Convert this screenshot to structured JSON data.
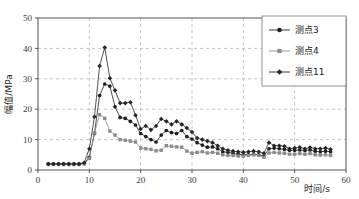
{
  "chart_data": {
    "type": "line",
    "title": "",
    "xlabel": "时间/s",
    "ylabel": "幅值/MPa",
    "xlim": [
      0,
      60
    ],
    "ylim": [
      0,
      50
    ],
    "xticks": [
      0,
      10,
      20,
      30,
      40,
      50,
      60
    ],
    "yticks": [
      0,
      10,
      20,
      30,
      40,
      50
    ],
    "grid": true,
    "legend_position": "top-right",
    "series": [
      {
        "name": "测点3",
        "color": "#1f1f1f",
        "marker": "circle",
        "x": [
          2,
          3,
          4,
          5,
          6,
          7,
          8,
          9,
          10,
          11,
          12,
          13,
          14,
          15,
          16,
          17,
          18,
          19,
          20,
          21,
          22,
          23,
          24,
          25,
          26,
          27,
          28,
          29,
          30,
          31,
          32,
          33,
          34,
          35,
          36,
          37,
          38,
          39,
          40,
          41,
          42,
          43,
          44,
          45,
          46,
          47,
          48,
          49,
          50,
          51,
          52,
          53,
          54,
          55,
          56,
          57
        ],
        "values": [
          2.0,
          2.0,
          2.0,
          2.0,
          2.0,
          2.0,
          2.0,
          2.2,
          4.2,
          12.0,
          24.5,
          28.3,
          27.6,
          20.8,
          17.3,
          17.0,
          16.0,
          14.8,
          12.0,
          11.0,
          10.0,
          9.2,
          11.5,
          13.0,
          12.3,
          12.0,
          13.0,
          11.0,
          10.2,
          9.0,
          8.2,
          7.5,
          7.6,
          7.0,
          6.0,
          5.8,
          5.5,
          5.2,
          5.0,
          5.0,
          5.2,
          5.0,
          4.6,
          7.0,
          7.2,
          7.0,
          6.8,
          6.5,
          6.5,
          6.6,
          6.4,
          6.6,
          6.2,
          6.0,
          6.2,
          6.0
        ]
      },
      {
        "name": "测点4",
        "color": "#8c8c8c",
        "marker": "square",
        "x": [
          2,
          3,
          4,
          5,
          6,
          7,
          8,
          9,
          10,
          11,
          12,
          13,
          14,
          15,
          16,
          17,
          18,
          19,
          20,
          21,
          22,
          23,
          24,
          25,
          26,
          27,
          28,
          29,
          30,
          31,
          32,
          33,
          34,
          35,
          36,
          37,
          38,
          39,
          40,
          41,
          42,
          43,
          44,
          45,
          46,
          47,
          48,
          49,
          50,
          51,
          52,
          53,
          54,
          55,
          56,
          57
        ],
        "values": [
          1.8,
          1.8,
          1.8,
          1.8,
          1.8,
          1.8,
          1.8,
          2.0,
          3.8,
          12.2,
          18.2,
          17.0,
          12.8,
          11.5,
          10.0,
          9.8,
          9.5,
          9.2,
          7.2,
          7.0,
          6.8,
          6.3,
          6.5,
          8.0,
          7.8,
          7.6,
          7.5,
          6.2,
          5.5,
          5.8,
          6.0,
          5.6,
          5.8,
          5.5,
          5.0,
          4.8,
          4.8,
          4.6,
          4.6,
          4.8,
          5.0,
          4.8,
          4.2,
          5.6,
          5.8,
          5.6,
          5.5,
          5.2,
          5.2,
          5.4,
          5.2,
          5.4,
          5.0,
          4.9,
          5.0,
          4.8
        ]
      },
      {
        "name": "测点11",
        "color": "#262626",
        "marker": "diamond",
        "x": [
          2,
          3,
          4,
          5,
          6,
          7,
          8,
          9,
          10,
          11,
          12,
          13,
          14,
          15,
          16,
          17,
          18,
          19,
          20,
          21,
          22,
          23,
          24,
          25,
          26,
          27,
          28,
          29,
          30,
          31,
          32,
          33,
          34,
          35,
          36,
          37,
          38,
          39,
          40,
          41,
          42,
          43,
          44,
          45,
          46,
          47,
          48,
          49,
          50,
          51,
          52,
          53,
          54,
          55,
          56,
          57
        ],
        "values": [
          2.0,
          2.0,
          2.0,
          2.0,
          2.0,
          2.0,
          2.0,
          2.4,
          7.0,
          17.5,
          34.2,
          40.3,
          30.2,
          26.2,
          22.0,
          22.0,
          22.3,
          18.0,
          13.5,
          14.5,
          13.2,
          14.5,
          16.8,
          16.0,
          15.0,
          16.0,
          15.0,
          13.8,
          12.5,
          10.5,
          10.0,
          9.5,
          9.0,
          8.0,
          7.0,
          6.5,
          6.2,
          6.0,
          5.8,
          6.0,
          6.2,
          6.0,
          5.5,
          9.0,
          8.0,
          8.0,
          7.8,
          7.0,
          7.2,
          7.5,
          7.0,
          7.4,
          7.0,
          7.0,
          7.2,
          6.8
        ]
      }
    ]
  }
}
